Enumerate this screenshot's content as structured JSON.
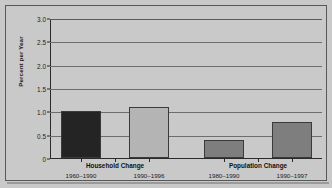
{
  "chart_data": {
    "type": "bar",
    "title": "",
    "subtitle": "",
    "xlabel": "",
    "ylabel": "Percent per Year",
    "ylim": [
      0,
      3.0
    ],
    "grid": true,
    "legend": "none",
    "y_ticks": [
      "0",
      "0.5",
      "1.0",
      "1.5",
      "2.0",
      "2.5",
      "3.0"
    ],
    "y_tick_values": [
      0,
      0.5,
      1.0,
      1.5,
      2.0,
      2.5,
      3.0
    ],
    "groups": [
      {
        "label": "Household Change",
        "bars": [
          {
            "period": "1960–1990",
            "value": 1.0,
            "color": "#242424"
          },
          {
            "period": "1990–1996",
            "value": 1.1,
            "color": "#b4b4b4"
          }
        ]
      },
      {
        "label": "Population Change",
        "bars": [
          {
            "period": "1980–1990",
            "value": 0.38,
            "color": "#7e7e7e"
          },
          {
            "period": "1990–1997",
            "value": 0.78,
            "color": "#7e7e7e"
          }
        ]
      }
    ],
    "categories": [
      "Household Change 1960–1990",
      "Household Change 1990–1996",
      "Population Change 1980–1990",
      "Population Change 1990–1997"
    ],
    "values": [
      1.0,
      1.1,
      0.38,
      0.78
    ],
    "colors": {
      "background": "#c9c9c9",
      "frame_border": "#575757",
      "axis": "#2a2a2a",
      "gridline": "#6d6d6d",
      "bar_dark": "#242424",
      "bar_light": "#b4b4b4",
      "bar_medium": "#7e7e7e"
    }
  }
}
